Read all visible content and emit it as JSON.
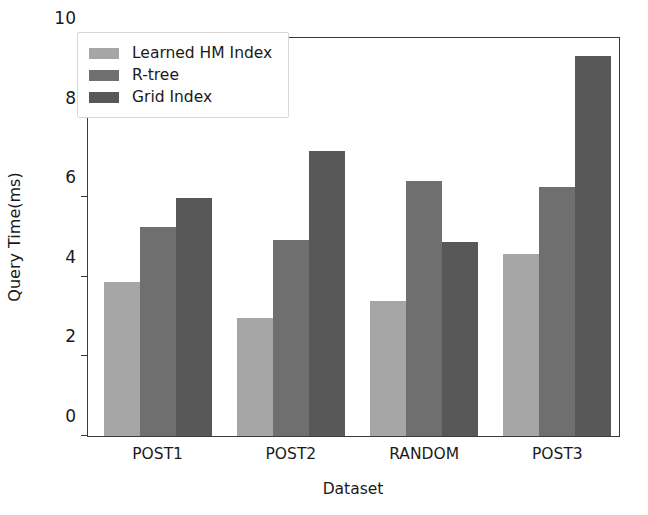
{
  "chart_data": {
    "type": "bar",
    "title": "",
    "xlabel": "Dataset",
    "ylabel": "Query Time(ms)",
    "categories": [
      "POST1",
      "POST2",
      "RANDOM",
      "POST3"
    ],
    "series": [
      {
        "name": "Learned HM Index",
        "color": "#a6a6a6",
        "values": [
          3.87,
          2.97,
          3.38,
          4.57
        ]
      },
      {
        "name": "R-tree",
        "color": "#6f6f6f",
        "values": [
          5.25,
          4.93,
          6.4,
          6.25
        ]
      },
      {
        "name": "Grid Index",
        "color": "#585858",
        "values": [
          5.97,
          7.17,
          4.88,
          9.55
        ]
      }
    ],
    "ylim": [
      0,
      10
    ],
    "yticks": [
      0,
      2,
      4,
      6,
      8,
      10
    ],
    "ytick_labels": [
      "0",
      "2",
      "4",
      "6",
      "8",
      "10"
    ],
    "grid": false,
    "legend_position": "upper left",
    "axes_color": "#3a3a3a",
    "background": "#ffffff"
  }
}
